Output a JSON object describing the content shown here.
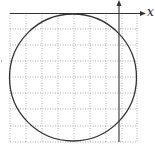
{
  "diagram": {
    "type": "circle-on-grid",
    "axes": {
      "x_label": "x",
      "y_label": "y"
    },
    "grid": {
      "columns": 8,
      "rows": 8,
      "style": "dotted"
    },
    "circle": {
      "tangent_to": "x-axis",
      "description": "circle below x-axis, tangent at top"
    },
    "colors": {
      "grid": "#9a9a9a",
      "circle": "#333333",
      "axis": "#333333"
    }
  }
}
